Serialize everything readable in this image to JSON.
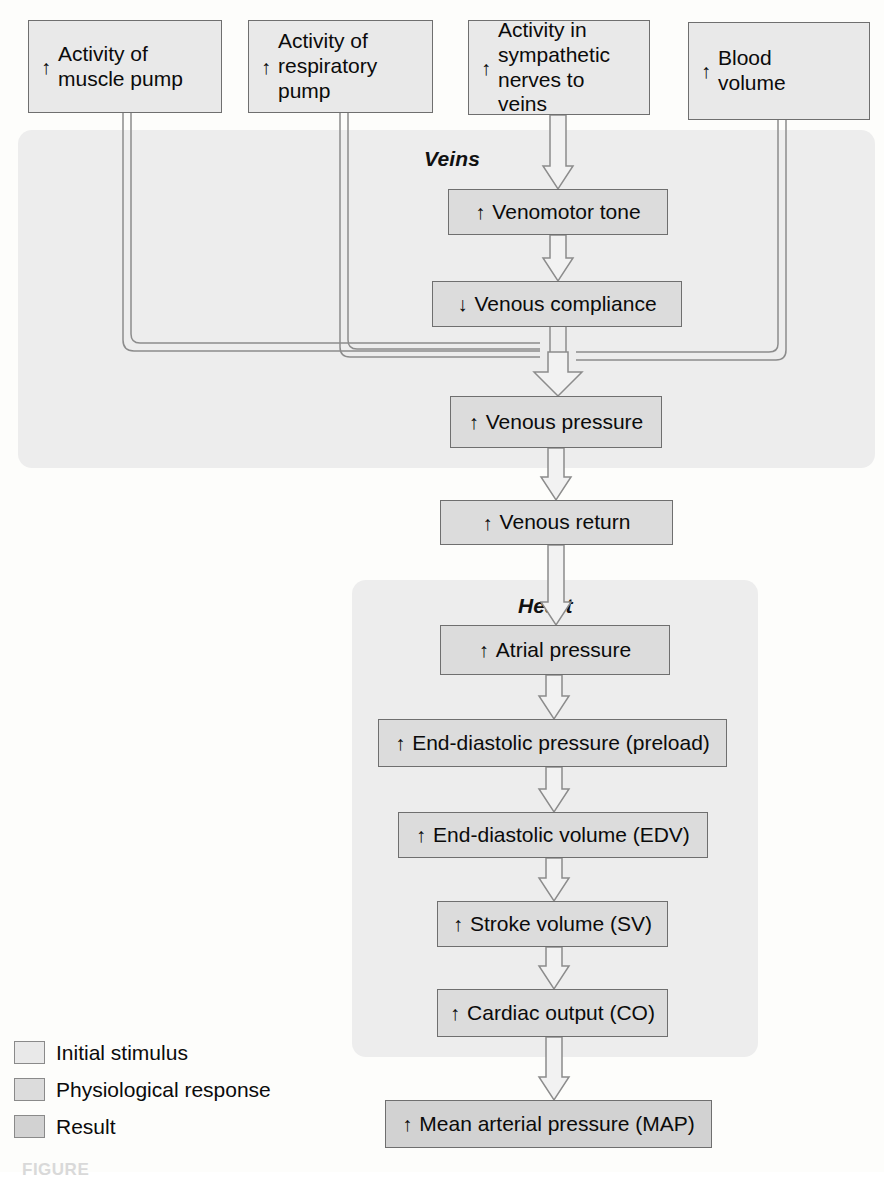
{
  "figure": {
    "caption_partial": "FIGURE",
    "panels": [
      {
        "id": "veins",
        "label": "Veins"
      },
      {
        "id": "heart",
        "label": "Heart"
      }
    ]
  },
  "nodes": {
    "muscle_pump": {
      "arrow": "↑",
      "text": "Activity of\nmuscle pump",
      "category": "Initial stimulus"
    },
    "resp_pump": {
      "arrow": "↑",
      "text": "Activity of\nrespiratory\npump",
      "category": "Initial stimulus"
    },
    "symp_nerves": {
      "arrow": "↑",
      "text": "Activity in\nsympathetic\nnerves to veins",
      "category": "Initial stimulus"
    },
    "blood_volume": {
      "arrow": "↑",
      "text": "Blood\nvolume",
      "category": "Initial stimulus"
    },
    "venomotor": {
      "arrow": "↑",
      "text": "Venomotor tone",
      "category": "Physiological response"
    },
    "compliance": {
      "arrow": "↓",
      "text": "Venous compliance",
      "category": "Physiological response"
    },
    "venous_press": {
      "arrow": "↑",
      "text": "Venous pressure",
      "category": "Physiological response"
    },
    "venous_return": {
      "arrow": "↑",
      "text": "Venous return",
      "category": "Physiological response"
    },
    "atrial_press": {
      "arrow": "↑",
      "text": "Atrial pressure",
      "category": "Physiological response"
    },
    "edp": {
      "arrow": "↑",
      "text": "End-diastolic pressure (preload)",
      "category": "Physiological response"
    },
    "edv": {
      "arrow": "↑",
      "text": "End-diastolic volume (EDV)",
      "category": "Physiological response"
    },
    "sv": {
      "arrow": "↑",
      "text": "Stroke volume (SV)",
      "category": "Physiological response"
    },
    "co": {
      "arrow": "↑",
      "text": "Cardiac output (CO)",
      "category": "Physiological response"
    },
    "map": {
      "arrow": "↑",
      "text": "Mean arterial pressure (MAP)",
      "category": "Result"
    }
  },
  "legend": {
    "items": [
      {
        "label": "Initial stimulus",
        "color": "#e9e9e9"
      },
      {
        "label": "Physiological response",
        "color": "#dcdcdc"
      },
      {
        "label": "Result",
        "color": "#d2d2d2"
      }
    ]
  },
  "colors": {
    "panel_fill": "#ededed",
    "box_border": "#6f6f6f",
    "connector": "#8c8c8c",
    "page_bg": "#fdfdfb"
  }
}
